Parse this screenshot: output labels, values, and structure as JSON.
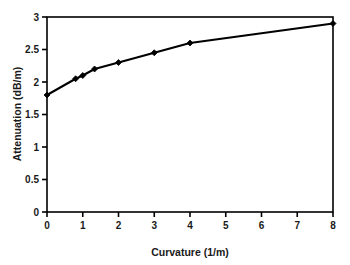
{
  "chart_data": {
    "type": "line",
    "title": "",
    "subtitle": "",
    "xlabel": "Curvature (1/m)",
    "ylabel": "Attenuation (dB/m)",
    "xlim": [
      0,
      8
    ],
    "ylim": [
      0,
      3
    ],
    "grid": false,
    "legend": null,
    "legend_position": "none",
    "marker": "filled-diamond",
    "line_color": "#000000",
    "marker_color": "#000000",
    "x_ticks": [
      "0",
      "1",
      "2",
      "3",
      "4",
      "5",
      "6",
      "7",
      "8"
    ],
    "x_tick_values": [
      0,
      1,
      2,
      3,
      4,
      5,
      6,
      7,
      8
    ],
    "y_ticks": [
      "0",
      "0.5",
      "1",
      "1.5",
      "2",
      "2.5",
      "3"
    ],
    "y_tick_values": [
      0,
      0.5,
      1,
      1.5,
      2,
      2.5,
      3
    ],
    "x": [
      0,
      0.8,
      1.0,
      1.33,
      2.0,
      3.0,
      4.0,
      8.0
    ],
    "values": [
      1.8,
      2.05,
      2.1,
      2.2,
      2.3,
      2.45,
      2.6,
      2.9
    ],
    "series": [
      {
        "name": "Attenuation vs curvature",
        "x": [
          0,
          0.8,
          1.0,
          1.33,
          2.0,
          3.0,
          4.0,
          8.0
        ],
        "values": [
          1.8,
          2.05,
          2.1,
          2.2,
          2.3,
          2.45,
          2.6,
          2.9
        ]
      }
    ]
  },
  "figure": {
    "background_color": "#ffffff",
    "frame_color": "#000000"
  }
}
